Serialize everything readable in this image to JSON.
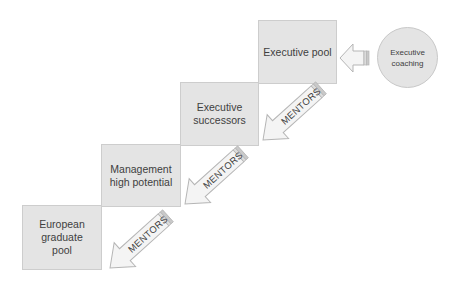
{
  "diagram": {
    "stages": [
      {
        "id": "european-graduate-pool",
        "lines": [
          "European",
          "graduate",
          "pool"
        ]
      },
      {
        "id": "management-high-potential",
        "lines": [
          "Management",
          "high potential"
        ]
      },
      {
        "id": "executive-successors",
        "lines": [
          "Executive",
          "successors"
        ]
      },
      {
        "id": "executive-pool",
        "lines": [
          "Executive pool"
        ]
      }
    ],
    "coaching": {
      "lines": [
        "Executive",
        "coaching"
      ]
    },
    "arrows": [
      {
        "from": "executive-pool",
        "to": "executive-successors",
        "label": "MENTORS"
      },
      {
        "from": "executive-successors",
        "to": "management-high-potential",
        "label": "MENTORS"
      },
      {
        "from": "management-high-potential",
        "to": "european-graduate-pool",
        "label": "MENTORS"
      },
      {
        "from": "executive-coaching",
        "to": "executive-pool",
        "label": ""
      }
    ],
    "colors": {
      "box_fill": "#e4e4e4",
      "box_border": "#cdcdcd",
      "arrow_fill": "#f4f4f4",
      "arrow_border": "#b8b8b8",
      "text": "#404040"
    }
  }
}
